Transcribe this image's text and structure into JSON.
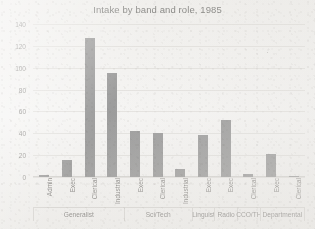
{
  "chart_data": {
    "type": "bar",
    "title": "Intake by band and role, 1985",
    "xlabel": "",
    "ylabel": "",
    "ylim": [
      0,
      140
    ],
    "yticks": [
      0,
      20,
      40,
      60,
      80,
      100,
      120,
      140
    ],
    "grid": true,
    "legend": "none",
    "categories": [
      "Admin",
      "Exec",
      "Clerical",
      "Industrial",
      "Exec",
      "Clerical",
      "Industrial",
      "Exec",
      "Exec",
      "Clerical",
      "Exec",
      "Clerical"
    ],
    "values": [
      2,
      16,
      127,
      95,
      42,
      40,
      7,
      38,
      52,
      3,
      21,
      1
    ],
    "groups": [
      {
        "label": "Generalist",
        "span": 4
      },
      {
        "label": "Sci/Tech",
        "span": 3
      },
      {
        "label": "Linguist",
        "span": 1
      },
      {
        "label": "Radio",
        "span": 1
      },
      {
        "label": "CCO/TH",
        "span": 1
      },
      {
        "label": "Departmental",
        "span": 2
      }
    ],
    "bar_color": "#7b7b7b",
    "gridline_color": "#dcdad6",
    "background_color": "#f2f1ef",
    "text_color": "#585653"
  }
}
